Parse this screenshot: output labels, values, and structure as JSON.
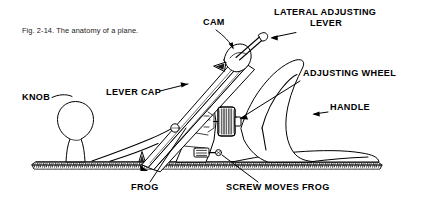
{
  "figure": {
    "caption": "Fig. 2-14. The anatomy of a plane.",
    "background_color": "#ffffff",
    "ink_color": "#000000"
  },
  "labels": [
    {
      "id": "knob",
      "text": "KNOB",
      "x": 22,
      "y": 100,
      "anchor": "start"
    },
    {
      "id": "lever-cap",
      "text": "LEVER CAP",
      "x": 106,
      "y": 95,
      "anchor": "start"
    },
    {
      "id": "cam",
      "text": "CAM",
      "x": 203,
      "y": 25,
      "anchor": "start"
    },
    {
      "id": "lateral-line1",
      "text": "LATERAL ADJUSTING",
      "x": 274,
      "y": 15,
      "anchor": "start"
    },
    {
      "id": "lateral-line2",
      "text": "LEVER",
      "x": 310,
      "y": 26,
      "anchor": "start"
    },
    {
      "id": "adjusting-wheel",
      "text": "ADJUSTING WHEEL",
      "x": 303,
      "y": 76,
      "anchor": "start"
    },
    {
      "id": "handle",
      "text": "HANDLE",
      "x": 330,
      "y": 110,
      "anchor": "start"
    },
    {
      "id": "frog",
      "text": "FROG",
      "x": 131,
      "y": 190,
      "anchor": "start"
    },
    {
      "id": "screw-moves-frog",
      "text": "SCREW MOVES FROG",
      "x": 226,
      "y": 190,
      "anchor": "start"
    }
  ],
  "label_groups": {
    "lateral_adjusting_lever_full": "LATERAL ADJUSTING LEVER"
  },
  "parts": [
    "knob",
    "lever cap",
    "cam",
    "lateral adjusting lever",
    "adjusting wheel",
    "handle",
    "frog",
    "screw moves frog",
    "plane body / sole",
    "blade (iron)"
  ]
}
